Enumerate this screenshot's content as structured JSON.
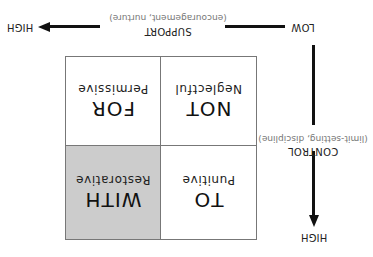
{
  "diagram": {
    "orientation": "rotated 180 degrees",
    "x_axis": {
      "label": "SUPPORT",
      "sublabel": "(encouragement, nurture)",
      "low": "LOW",
      "high": "HIGH"
    },
    "y_axis": {
      "label": "CONTROL",
      "sublabel": "(limit-setting, discipline)",
      "high": "HIGH"
    },
    "cells": [
      {
        "title": "TO",
        "subtitle": "Punitive",
        "highlighted": false
      },
      {
        "title": "WITH",
        "subtitle": "Restorative",
        "highlighted": true
      },
      {
        "title": "NOT",
        "subtitle": "Neglectful",
        "highlighted": false
      },
      {
        "title": "FOR",
        "subtitle": "Permissive",
        "highlighted": false
      }
    ],
    "colors": {
      "highlight": "#cccccc",
      "border": "#777777",
      "line": "#111111"
    }
  }
}
